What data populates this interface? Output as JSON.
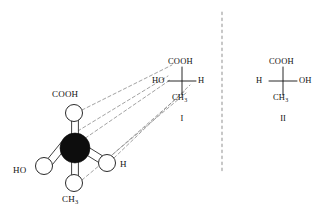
{
  "figure": {
    "type": "stereochemistry-diagram",
    "colors": {
      "background": "#ffffff",
      "bond_stroke": "#2a2a2a",
      "central_atom_fill": "#0d0d0d",
      "substituent_fill": "#ffffff",
      "substituent_stroke": "#2a2a2a",
      "projection_dash": "#8a8a8a",
      "mirror_dash": "#9a9a9a",
      "text": "#111111"
    }
  },
  "ball_model": {
    "name": "ball-and-stick-model",
    "central_atom": {
      "name": "central-carbon",
      "cx": 75,
      "cy": 148,
      "r": 15
    },
    "substituents": [
      {
        "key": "cooh",
        "label": "COOH",
        "sub": "",
        "cx": 74,
        "cy": 113,
        "r": 8.5,
        "label_x": 52,
        "label_y": 95
      },
      {
        "key": "ho",
        "label": "HO",
        "sub": "",
        "cx": 44,
        "cy": 166,
        "r": 8.5,
        "label_x": 13,
        "label_y": 171
      },
      {
        "key": "h",
        "label": "H",
        "sub": "",
        "cx": 107,
        "cy": 163,
        "r": 8.5,
        "label_x": 120,
        "label_y": 166
      },
      {
        "key": "ch3",
        "label": "CH",
        "sub": "3",
        "cx": 74,
        "cy": 183,
        "r": 8.5,
        "label_x": 62,
        "label_y": 197
      }
    ]
  },
  "fischer_projections": [
    {
      "name": "fischer-projection-one",
      "numeral": "I",
      "center_x": 182,
      "center_y": 81,
      "arm": 14,
      "numeral_x": 182,
      "numeral_y": 116,
      "top": "COOH",
      "left": "HO",
      "right": "H",
      "bottom": "CH",
      "bottom_sub": "3"
    },
    {
      "name": "fischer-projection-two",
      "numeral": "II",
      "center_x": 283,
      "center_y": 81,
      "arm": 14,
      "numeral_x": 283,
      "numeral_y": 116,
      "top": "COOH",
      "left": "H",
      "right": "OH",
      "bottom": "CH",
      "bottom_sub": "3"
    }
  ],
  "mirror_line": {
    "name": "mirror-plane-divider",
    "x": 222,
    "y_start": 12,
    "y_end": 172
  },
  "projection_rays": {
    "name": "projection-rays",
    "count": 4,
    "description": "Dashed guide lines mapping each substituent sphere of the ball model onto Fischer projection I"
  }
}
